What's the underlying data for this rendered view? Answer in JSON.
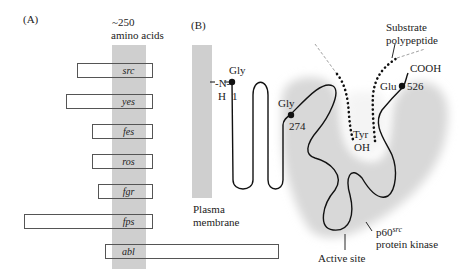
{
  "panel_a": {
    "label": "(A)",
    "domain_width_label_line1": "~250",
    "domain_width_label_line2": "amino acids",
    "genes": [
      {
        "name": "src",
        "x": 77,
        "y": 63,
        "w": 76
      },
      {
        "name": "yes",
        "x": 66,
        "y": 94,
        "w": 87
      },
      {
        "name": "fes",
        "x": 92,
        "y": 124,
        "w": 61
      },
      {
        "name": "ros",
        "x": 92,
        "y": 154,
        "w": 61
      },
      {
        "name": "fgr",
        "x": 98,
        "y": 184,
        "w": 55
      },
      {
        "name": "fps",
        "x": 24,
        "y": 214,
        "w": 129
      },
      {
        "name": "abl",
        "x": 105,
        "y": 244,
        "w": 174
      }
    ]
  },
  "panel_b": {
    "label": "(B)",
    "membrane_label_line1": "Plasma",
    "membrane_label_line2": "membrane",
    "n_terminus": "-N-",
    "n_h": "H",
    "gly1_label": "Gly",
    "gly1_number": "1",
    "gly274_label": "Gly",
    "gly274_number": "274",
    "glu526_label": "Glu",
    "glu526_number": "526",
    "cooh_label": "COOH",
    "tyr_label": "Tyr",
    "oh_label": "OH",
    "substrate_label_line1": "Substrate",
    "substrate_label_line2": "polypeptide",
    "kinase_label_main": "p60",
    "kinase_label_sup": "src",
    "kinase_label_line2": "protein kinase",
    "active_site_label": "Active site"
  },
  "colors": {
    "membrane_gray": "#cfcfcf",
    "domain_gray": "#cfcfcf",
    "line": "#111111",
    "blob_gray": "#d9d9d9"
  }
}
